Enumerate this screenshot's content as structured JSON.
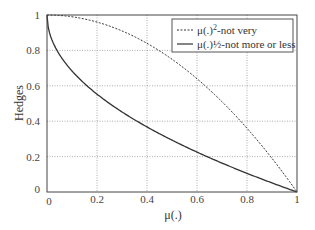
{
  "chart_data": {
    "type": "line",
    "title": "",
    "xlabel": "μ(.)",
    "ylabel": "Hedges",
    "xlim": [
      0,
      1
    ],
    "ylim": [
      0,
      1
    ],
    "grid": true,
    "legend_position": "upper right",
    "x_ticks": [
      "0",
      "0.2",
      "0.4",
      "0.6",
      "0.8",
      "1"
    ],
    "y_ticks": [
      "0",
      "0.2",
      "0.4",
      "0.6",
      "0.8",
      "1"
    ],
    "x": [
      0,
      0.05,
      0.1,
      0.15,
      0.2,
      0.25,
      0.3,
      0.35,
      0.4,
      0.45,
      0.5,
      0.55,
      0.6,
      0.65,
      0.7,
      0.75,
      0.8,
      0.85,
      0.9,
      0.95,
      1
    ],
    "series": [
      {
        "name": "μ(.)²-not very",
        "style": "dashed",
        "color": "#333333",
        "values": [
          1,
          0.998,
          0.99,
          0.978,
          0.96,
          0.938,
          0.91,
          0.878,
          0.84,
          0.798,
          0.75,
          0.698,
          0.64,
          0.578,
          0.51,
          0.438,
          0.36,
          0.278,
          0.19,
          0.098,
          0
        ]
      },
      {
        "name": "μ(.)½-not more or less",
        "style": "solid",
        "color": "#333333",
        "values": [
          1,
          0.776,
          0.684,
          0.613,
          0.553,
          0.5,
          0.452,
          0.408,
          0.368,
          0.329,
          0.293,
          0.258,
          0.225,
          0.194,
          0.163,
          0.134,
          0.106,
          0.078,
          0.051,
          0.025,
          0
        ]
      }
    ]
  },
  "legend": {
    "items": [
      {
        "label_prefix": "μ(.)",
        "superscript": "2",
        "label_suffix": "-not very"
      },
      {
        "label_prefix": "μ(.)½-not more or less",
        "superscript": "",
        "label_suffix": ""
      }
    ]
  },
  "axes": {
    "xlabel": "μ(.)",
    "ylabel": "Hedges",
    "x_ticks": [
      "0",
      "0.2",
      "0.4",
      "0.6",
      "0.8",
      "1"
    ],
    "y_ticks": [
      "0",
      "0.2",
      "0.4",
      "0.6",
      "0.8",
      "1"
    ]
  }
}
